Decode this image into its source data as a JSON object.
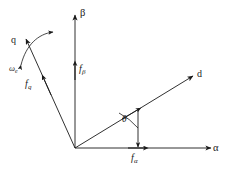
{
  "figure": {
    "type": "vector-diagram",
    "background_color": "#ffffff",
    "line_color": "#1a1a1a",
    "text_color": "#1a1a1a"
  },
  "watermark": {
    "text": ""
  },
  "axes": [
    {
      "id": "alpha",
      "label": "α",
      "description": "stationary horizontal axis",
      "origin": [
        75,
        148
      ],
      "tip": [
        214,
        148
      ],
      "angle_deg": 0
    },
    {
      "id": "beta",
      "label": "β",
      "description": "stationary vertical axis",
      "origin": [
        75,
        148
      ],
      "tip": [
        75,
        12
      ],
      "angle_deg": 90
    },
    {
      "id": "d",
      "label": "d",
      "description": "rotating direct axis",
      "origin": [
        75,
        148
      ],
      "tip": [
        196,
        74
      ],
      "angle_deg": 31
    },
    {
      "id": "q",
      "label": "q",
      "description": "rotating quadrature axis",
      "origin": [
        75,
        148
      ],
      "tip": [
        24,
        36
      ],
      "angle_deg": 121
    }
  ],
  "components": [
    {
      "id": "f-alpha",
      "symbol": "f",
      "subscript": "α",
      "label": "fα",
      "on_axis": "alpha",
      "arrow_tip": [
        144,
        148
      ],
      "label_pos": [
        124,
        153
      ]
    },
    {
      "id": "f-beta",
      "symbol": "f",
      "subscript": "β",
      "label": "fβ",
      "on_axis": "beta",
      "arrow_tip": [
        75,
        62
      ],
      "label_pos": [
        79,
        66
      ]
    },
    {
      "id": "f-d",
      "symbol": "f",
      "subscript": "d",
      "label": "",
      "on_axis": "d",
      "arrow_tip": [
        137,
        110
      ]
    },
    {
      "id": "f-q",
      "symbol": "f",
      "subscript": "q",
      "label": "fq",
      "on_axis": "q",
      "arrow_tip": [
        41,
        73
      ],
      "label_pos": [
        24,
        82
      ]
    }
  ],
  "annotations": {
    "angle": {
      "id": "theta",
      "label": "θ",
      "description": "angle between alpha axis and d axis",
      "vertex": [
        75,
        148
      ],
      "label_pos": [
        123,
        119
      ]
    },
    "rotation": {
      "id": "omega-e",
      "symbol": "ω",
      "subscript": "e",
      "label": "ωe",
      "description": "electrical angular speed of the rotating frame",
      "label_pos": [
        10,
        67
      ]
    }
  },
  "labels": {
    "alpha_axis": "α",
    "beta_axis": "β",
    "d_axis": "d",
    "q_axis": "q",
    "f_alpha_symbol": "f",
    "f_alpha_sub": "α",
    "f_beta_symbol": "f",
    "f_beta_sub": "β",
    "f_q_symbol": "f",
    "f_q_sub": "q",
    "theta": "θ",
    "omega_symbol": "ω",
    "omega_sub": "e"
  }
}
